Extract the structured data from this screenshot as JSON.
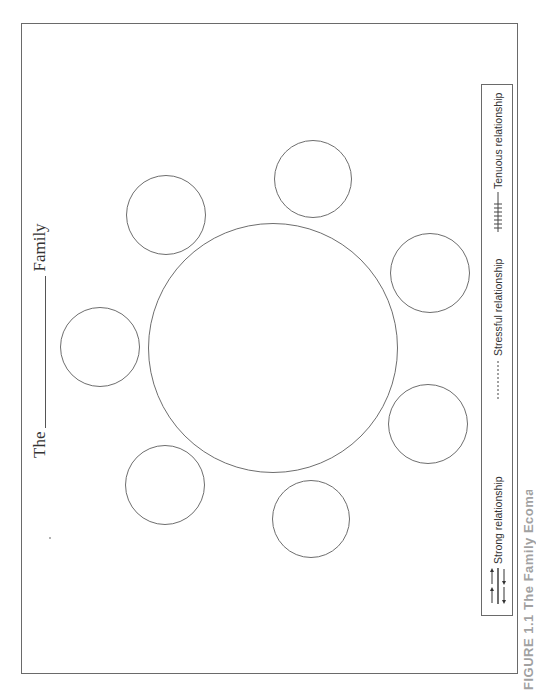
{
  "diagram": {
    "type": "family-ecomap-worksheet",
    "orientation": "rotated-90-ccw",
    "title": {
      "prefix": "The",
      "blank": "",
      "suffix": "Family"
    },
    "center_circle": {
      "label": "",
      "cx": 273,
      "cy": 348,
      "r": 125
    },
    "satellite_circles": [
      {
        "id": "top-left",
        "label": "",
        "cx": 166,
        "cy": 215,
        "r": 40
      },
      {
        "id": "top-right",
        "label": "",
        "cx": 313,
        "cy": 179,
        "r": 39
      },
      {
        "id": "left",
        "label": "",
        "cx": 100,
        "cy": 347,
        "r": 40
      },
      {
        "id": "right-upper",
        "label": "",
        "cx": 430,
        "cy": 273,
        "r": 40
      },
      {
        "id": "bottom-left",
        "label": "",
        "cx": 165,
        "cy": 485,
        "r": 40
      },
      {
        "id": "right-lower",
        "label": "",
        "cx": 428,
        "cy": 424,
        "r": 40
      },
      {
        "id": "bottom-right",
        "label": "",
        "cx": 311,
        "cy": 519,
        "r": 39
      }
    ],
    "legend": {
      "items": [
        {
          "symbol": "double-arrow-lines",
          "label": "Strong relationship"
        },
        {
          "symbol": "dashed-line",
          "label": "Stressful relationship"
        },
        {
          "symbol": "hatched-line",
          "label": "Tenuous relationship"
        }
      ]
    },
    "caption": "FIGURE 1.1 The Family Ecomap",
    "colors": {
      "stroke": "#6e6e6e",
      "text": "#333333",
      "background": "#ffffff"
    }
  }
}
